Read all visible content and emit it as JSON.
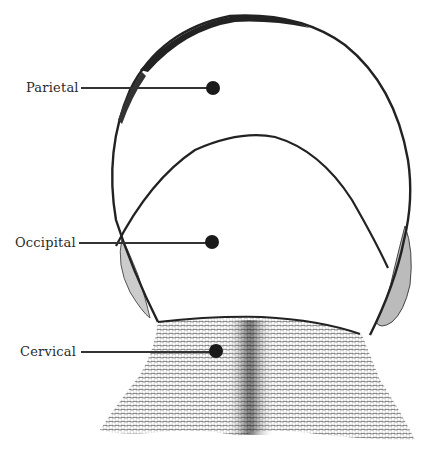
{
  "diagram": {
    "labels": [
      {
        "id": "parietal",
        "text": "Parietal",
        "x": 26,
        "y": 81,
        "dot": [
          213,
          88
        ]
      },
      {
        "id": "occipital",
        "text": "Occipital",
        "x": 15,
        "y": 236,
        "dot": [
          212,
          242
        ]
      },
      {
        "id": "cervical",
        "text": "Cervical",
        "x": 20,
        "y": 345,
        "dot": [
          216,
          351
        ]
      }
    ]
  },
  "colors": {
    "line": "#222222",
    "dot": "#1a1a1a",
    "hatch": "#333333",
    "background": "#ffffff"
  }
}
